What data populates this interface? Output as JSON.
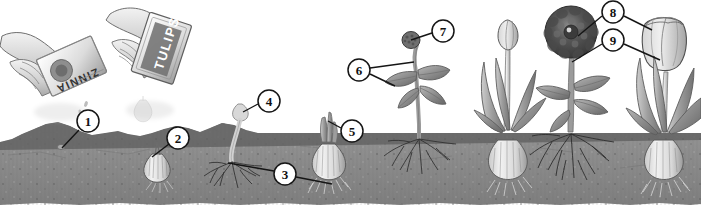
{
  "figure": {
    "width": 701,
    "height": 207,
    "background_color": "#ffffff",
    "soil_color": "#8f8f8f",
    "soil_dark_band_color": "#5a5a5a",
    "line_color": "#1a1a1a",
    "callout_fill": "#ffffff"
  },
  "packets": [
    {
      "id": "seed-packet",
      "label": "ZINNIA",
      "x": 55,
      "y": 75
    },
    {
      "id": "bulb-bag",
      "label": "TULIPS",
      "x": 185,
      "y": 45
    }
  ],
  "callouts": [
    {
      "number": "1",
      "cx": 88,
      "cy": 121,
      "r": 11,
      "leaders": [
        [
          79,
          130,
          62,
          148
        ]
      ]
    },
    {
      "number": "2",
      "cx": 178,
      "cy": 138,
      "r": 11,
      "leaders": [
        [
          169,
          144,
          152,
          157
        ]
      ]
    },
    {
      "number": "3",
      "cx": 285,
      "cy": 174,
      "r": 11,
      "leaders": [
        [
          274,
          171,
          228,
          163
        ],
        [
          296,
          177,
          332,
          184
        ]
      ]
    },
    {
      "number": "4",
      "cx": 269,
      "cy": 101,
      "r": 11,
      "leaders": [
        [
          258,
          104,
          243,
          112
        ]
      ]
    },
    {
      "number": "5",
      "cx": 352,
      "cy": 131,
      "r": 11,
      "leaders": [
        [
          341,
          128,
          328,
          121
        ]
      ]
    },
    {
      "number": "6",
      "cx": 359,
      "cy": 70,
      "r": 11,
      "leaders": [
        [
          370,
          68,
          414,
          62
        ],
        [
          370,
          74,
          395,
          86
        ]
      ]
    },
    {
      "number": "7",
      "cx": 443,
      "cy": 31,
      "r": 11,
      "leaders": [
        [
          432,
          33,
          411,
          40
        ]
      ]
    },
    {
      "number": "8",
      "cx": 613,
      "cy": 12,
      "r": 11,
      "leaders": [
        [
          602,
          16,
          578,
          36
        ],
        [
          624,
          16,
          652,
          30
        ]
      ]
    },
    {
      "number": "9",
      "cx": 613,
      "cy": 40,
      "r": 11,
      "leaders": [
        [
          602,
          44,
          572,
          62
        ],
        [
          624,
          44,
          660,
          60
        ]
      ]
    }
  ],
  "stages": [
    {
      "id": "stage-sow-seed",
      "label": "Hand sowing zinnia seed into hole in soil"
    },
    {
      "id": "stage-plant-bulb",
      "label": "Hand planting tulip bulb into hole in soil"
    },
    {
      "id": "stage-seed-sprout",
      "label": "Seed germinating with sprout and roots"
    },
    {
      "id": "stage-bulb-sprout",
      "label": "Bulb sprouting shoot with roots"
    },
    {
      "id": "stage-seedling",
      "label": "Zinnia seedling with leaves and flower bud"
    },
    {
      "id": "stage-tulip-bud",
      "label": "Tulip plant with closed bud"
    },
    {
      "id": "stage-zinnia-bloom",
      "label": "Zinnia in full bloom"
    },
    {
      "id": "stage-tulip-bloom",
      "label": "Tulip in full bloom"
    }
  ]
}
